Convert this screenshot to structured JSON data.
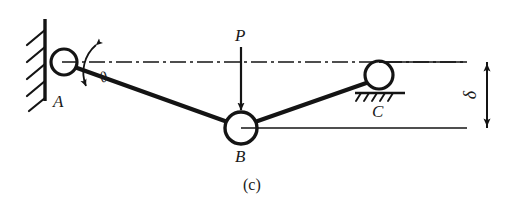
{
  "figure": {
    "caption": "(c)",
    "ink_color": "#141414",
    "background_color": "#ffffff"
  },
  "joints": [
    {
      "id": "A",
      "label": "A",
      "type": "pin-support",
      "cx": 64,
      "cy": 62,
      "r": 13
    },
    {
      "id": "B",
      "label": "B",
      "type": "hinge-joint",
      "cx": 241,
      "cy": 128,
      "r": 16
    },
    {
      "id": "C",
      "label": "C",
      "type": "roller-support",
      "cx": 379,
      "cy": 75,
      "r": 14
    }
  ],
  "labels": {
    "a": "A",
    "b": "B",
    "c": "C",
    "load": "P",
    "angle": "θ",
    "deflection": "δ"
  },
  "members": [
    {
      "name": "member-ab",
      "from": "A",
      "to": "B"
    },
    {
      "name": "member-bc",
      "from": "B",
      "to": "C"
    }
  ],
  "annotations": {
    "load_name": "P",
    "load_direction": "down",
    "angle_name": "θ",
    "angle_between": "centerline-and-member-ab",
    "deflection_name": "δ",
    "deflection_measures": "vertical-drop-of-B-below-AC-level"
  },
  "supports": {
    "wall": {
      "name": "fixed-wall",
      "hatch_count": 5
    },
    "roller_ground": {
      "name": "roller-ground",
      "hatch_count": 5
    }
  }
}
